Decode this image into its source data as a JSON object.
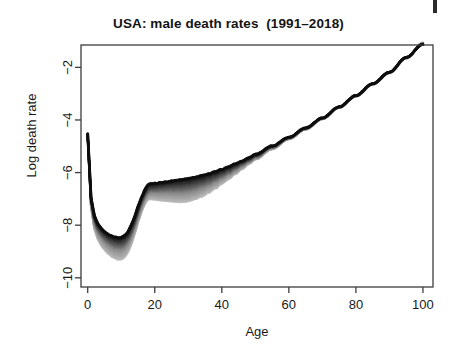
{
  "figure": {
    "width": 457,
    "height": 354,
    "background": "#ffffff",
    "page_edge_mark": "page-edge-artifact"
  },
  "chart_data": {
    "type": "line",
    "title": "USA: male death rates  (1991–2018)",
    "xlabel": "Age",
    "ylabel": "Log death rate",
    "xlim": [
      -2,
      103
    ],
    "ylim": [
      -10.35,
      -1.15
    ],
    "xticks": [
      0,
      20,
      40,
      60,
      80,
      100
    ],
    "yticks": [
      -2,
      -4,
      -6,
      -8,
      -10
    ],
    "xtick_labels": [
      "0",
      "20",
      "40",
      "60",
      "80",
      "100"
    ],
    "ytick_labels": [
      "−2",
      "−4",
      "−6",
      "−8",
      "−10"
    ],
    "grid": false,
    "legend": null,
    "legend_position": "none",
    "series_note": "One curve per calendar year 1991–2018; greyscale ramp from black (1991) to light grey (2018).",
    "year_range": [
      1991,
      2018
    ],
    "n_series": 28,
    "colors": {
      "first_year": "#101010",
      "mid_year": "#8c8c8c",
      "last_year": "#b8b8b8",
      "axis": "#3c3c3c",
      "text": "#191919"
    },
    "x": [
      0,
      1,
      2,
      3,
      4,
      5,
      6,
      7,
      8,
      9,
      10,
      11,
      12,
      13,
      14,
      15,
      16,
      17,
      18,
      19,
      20,
      22,
      24,
      26,
      28,
      30,
      32,
      34,
      36,
      38,
      40,
      42,
      44,
      46,
      48,
      50,
      55,
      60,
      65,
      70,
      75,
      80,
      85,
      90,
      95,
      100
    ],
    "series": [
      {
        "name": "1991",
        "shade": "#101010",
        "values": [
          -4.52,
          -6.95,
          -7.65,
          -7.95,
          -8.12,
          -8.25,
          -8.34,
          -8.4,
          -8.45,
          -8.47,
          -8.47,
          -8.4,
          -8.25,
          -8.0,
          -7.68,
          -7.3,
          -6.95,
          -6.66,
          -6.46,
          -6.42,
          -6.41,
          -6.38,
          -6.34,
          -6.3,
          -6.27,
          -6.23,
          -6.18,
          -6.12,
          -6.05,
          -5.97,
          -5.88,
          -5.78,
          -5.67,
          -5.56,
          -5.44,
          -5.31,
          -4.99,
          -4.66,
          -4.3,
          -3.92,
          -3.5,
          -3.07,
          -2.62,
          -2.18,
          -1.62,
          -1.12
        ]
      },
      {
        "name": "1998",
        "shade": "#555555",
        "values": [
          -4.58,
          -7.06,
          -7.79,
          -8.12,
          -8.3,
          -8.45,
          -8.56,
          -8.64,
          -8.7,
          -8.73,
          -8.73,
          -8.66,
          -8.5,
          -8.24,
          -7.9,
          -7.5,
          -7.13,
          -6.85,
          -6.66,
          -6.62,
          -6.62,
          -6.6,
          -6.58,
          -6.57,
          -6.56,
          -6.53,
          -6.47,
          -6.4,
          -6.3,
          -6.2,
          -6.08,
          -5.95,
          -5.81,
          -5.67,
          -5.53,
          -5.38,
          -5.03,
          -4.68,
          -4.32,
          -3.93,
          -3.51,
          -3.08,
          -2.63,
          -2.19,
          -1.63,
          -1.13
        ]
      },
      {
        "name": "2005",
        "shade": "#8c8c8c",
        "values": [
          -4.6,
          -7.15,
          -7.92,
          -8.27,
          -8.47,
          -8.63,
          -8.75,
          -8.84,
          -8.9,
          -8.94,
          -8.94,
          -8.86,
          -8.69,
          -8.42,
          -8.06,
          -7.65,
          -7.27,
          -6.98,
          -6.79,
          -6.76,
          -6.77,
          -6.77,
          -6.77,
          -6.78,
          -6.78,
          -6.75,
          -6.69,
          -6.6,
          -6.49,
          -6.36,
          -6.22,
          -6.07,
          -5.91,
          -5.75,
          -5.59,
          -5.43,
          -5.06,
          -4.7,
          -4.34,
          -3.95,
          -3.52,
          -3.09,
          -2.64,
          -2.2,
          -1.64,
          -1.1
        ]
      },
      {
        "name": "2012",
        "shade": "#a8a8a8",
        "values": [
          -4.62,
          -7.25,
          -8.05,
          -8.42,
          -8.64,
          -8.81,
          -8.94,
          -9.04,
          -9.11,
          -9.15,
          -9.15,
          -9.07,
          -8.89,
          -8.6,
          -8.22,
          -7.8,
          -7.41,
          -7.11,
          -6.92,
          -6.9,
          -6.92,
          -6.94,
          -6.95,
          -6.97,
          -6.98,
          -6.95,
          -6.88,
          -6.78,
          -6.65,
          -6.5,
          -6.34,
          -6.17,
          -5.99,
          -5.82,
          -5.64,
          -5.47,
          -5.09,
          -4.72,
          -4.35,
          -3.96,
          -3.53,
          -3.1,
          -2.65,
          -2.21,
          -1.65,
          -1.08
        ]
      },
      {
        "name": "2018",
        "shade": "#bdbdbd",
        "values": [
          -4.63,
          -7.32,
          -8.14,
          -8.53,
          -8.76,
          -8.94,
          -9.08,
          -9.18,
          -9.26,
          -9.3,
          -9.3,
          -9.22,
          -9.03,
          -8.73,
          -8.34,
          -7.91,
          -7.51,
          -7.2,
          -7.01,
          -7.0,
          -7.03,
          -7.06,
          -7.08,
          -7.11,
          -7.12,
          -7.09,
          -7.02,
          -6.91,
          -6.77,
          -6.61,
          -6.43,
          -6.25,
          -6.06,
          -5.87,
          -5.68,
          -5.5,
          -5.11,
          -4.73,
          -4.36,
          -3.97,
          -3.54,
          -3.11,
          -2.66,
          -2.22,
          -1.66,
          -1.06
        ]
      }
    ]
  }
}
